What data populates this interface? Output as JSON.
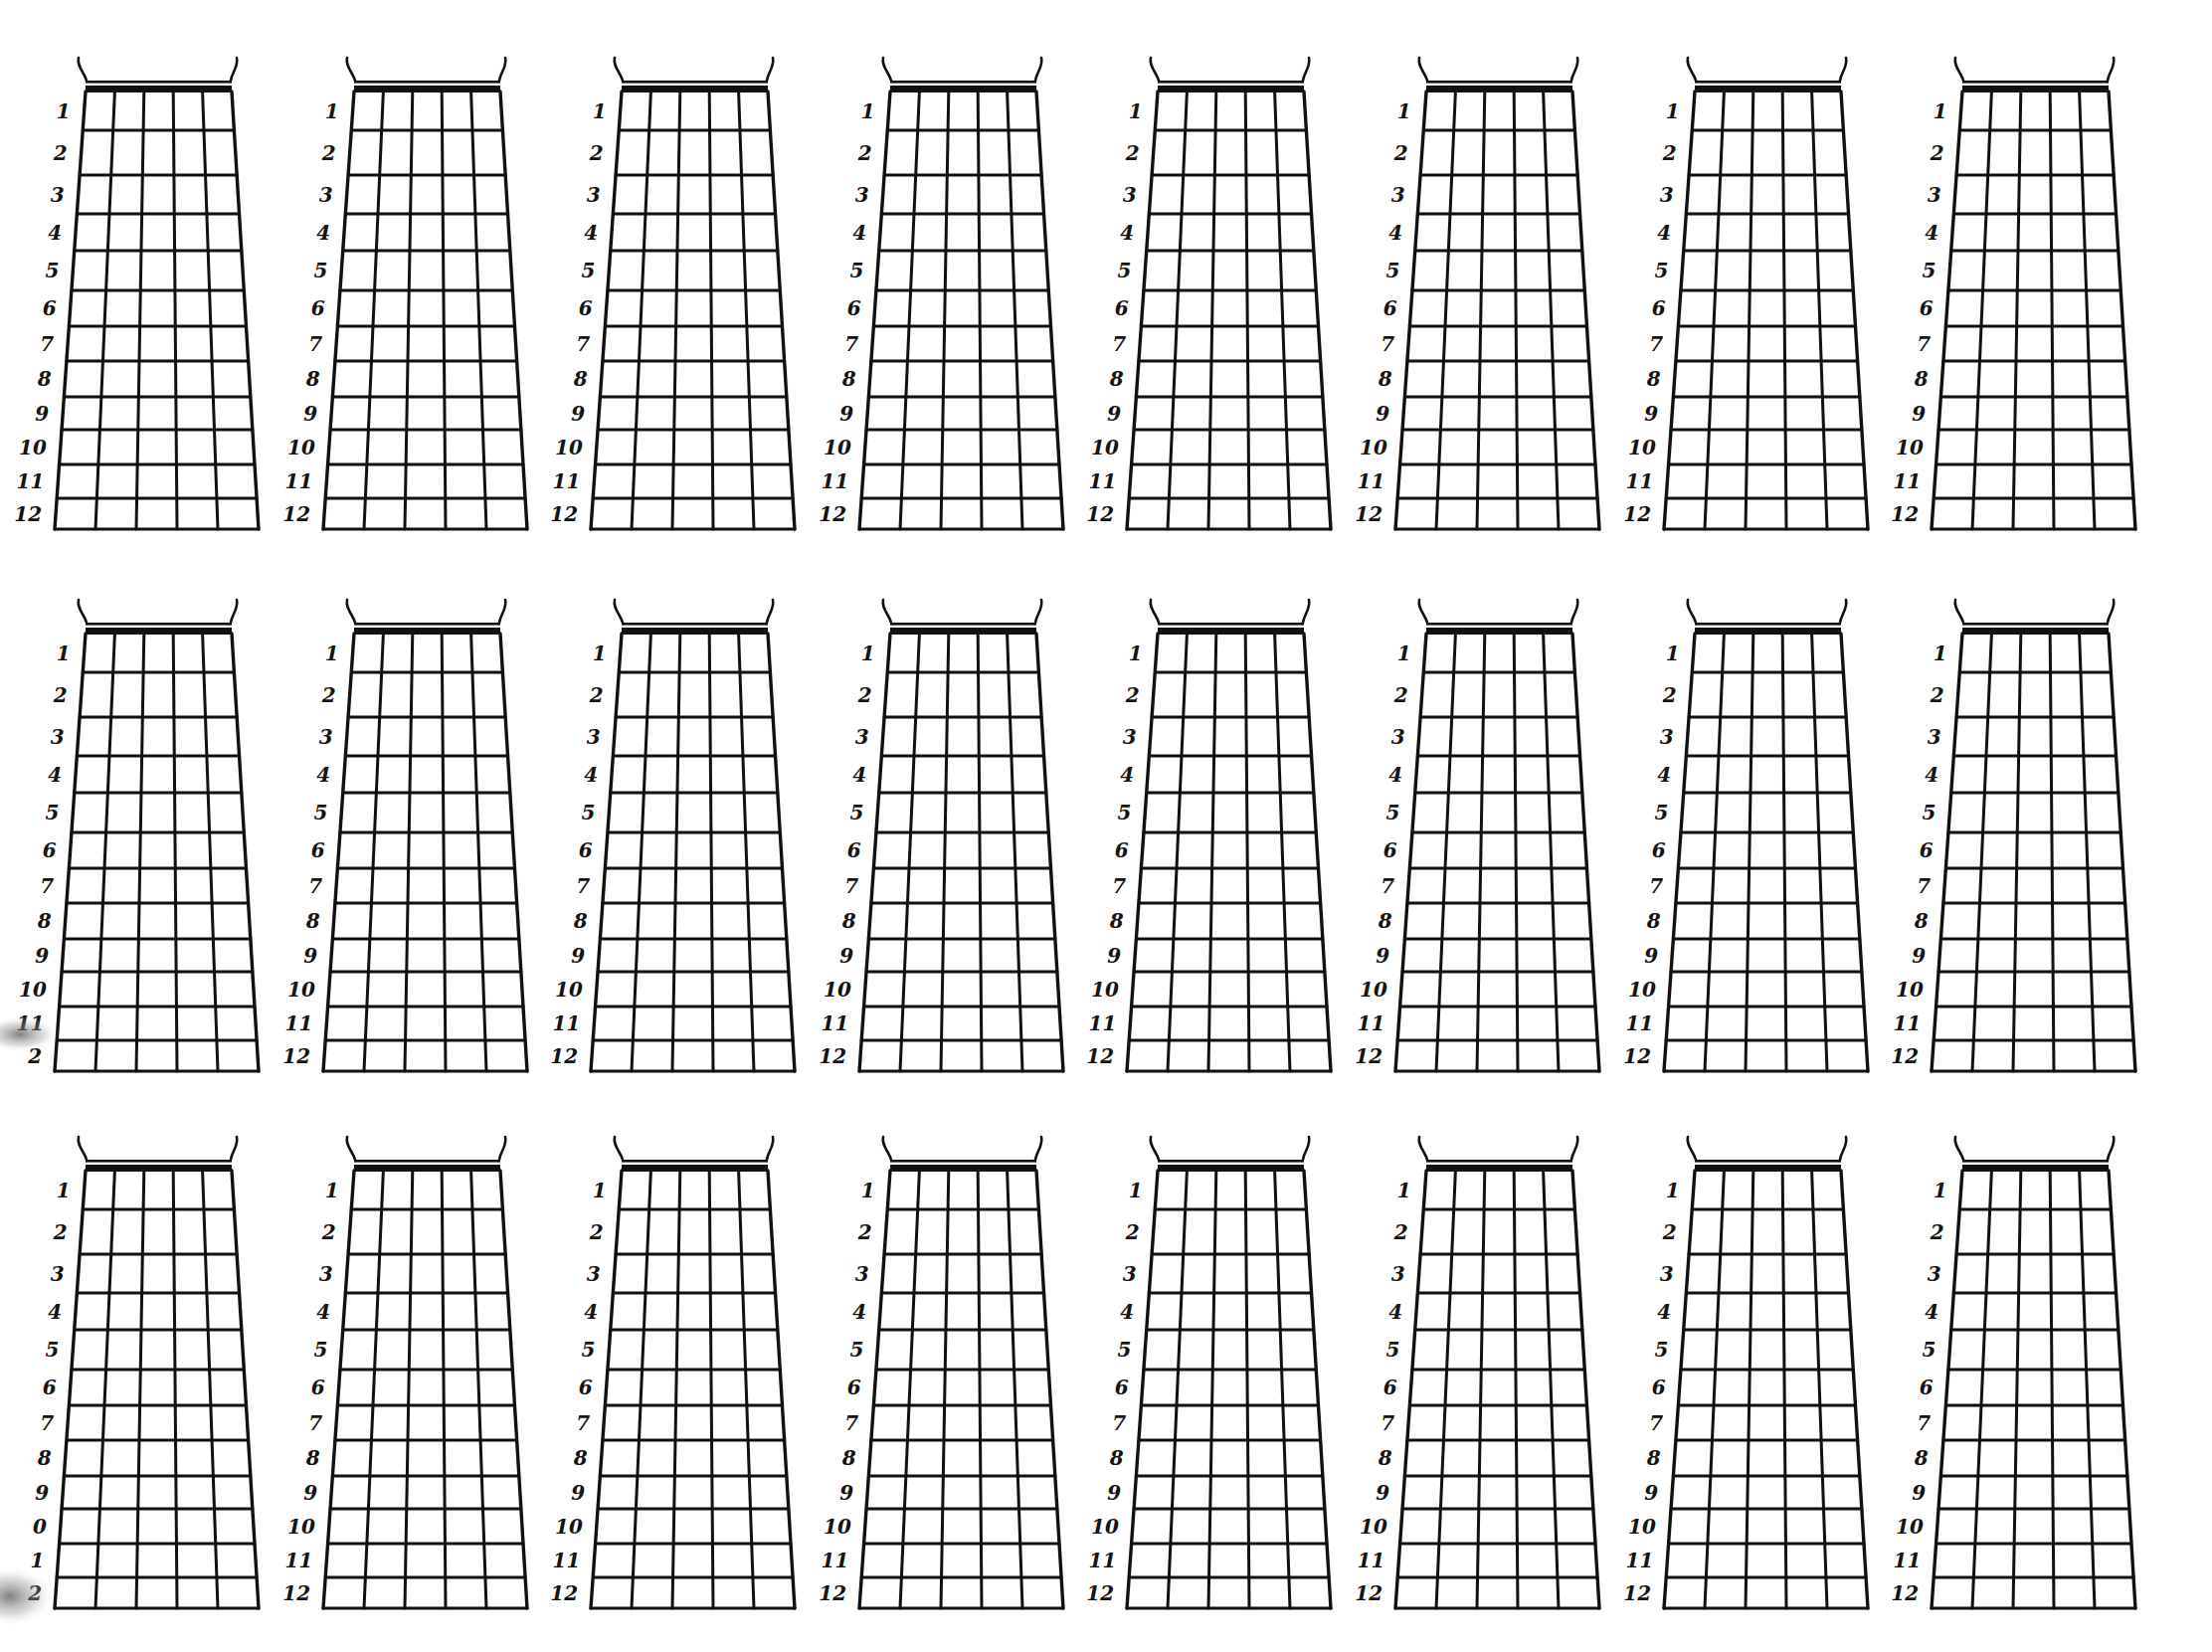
{
  "sheet": {
    "title": "Blank guitar fretboard chart sheet",
    "background": "#ffffff",
    "ink_color": "#111111",
    "rows": 3,
    "columns": 8,
    "strings_per_diagram": 6,
    "frets_per_diagram": 12
  },
  "layout": {
    "column_nut_x": [
      86,
      356,
      625,
      895,
      1164,
      1434,
      1704,
      1973
    ],
    "row_nut_y": [
      93,
      638,
      1178
    ],
    "nut_width": 147,
    "bottom_offset_left": -31,
    "bottom_width": 205,
    "height": 439,
    "fret_offsets": [
      38,
      83,
      122,
      159,
      199,
      235,
      270,
      306,
      339,
      374,
      408,
      439
    ]
  },
  "default_fret_labels": [
    "1",
    "2",
    "3",
    "4",
    "5",
    "6",
    "7",
    "8",
    "9",
    "10",
    "11",
    "12"
  ],
  "label_overrides": {
    "1-0": [
      "1",
      "2",
      "3",
      "4",
      "5",
      "6",
      "7",
      "8",
      "9",
      "10",
      "11",
      "2"
    ],
    "2-0": [
      "1",
      "2",
      "3",
      "4",
      "5",
      "6",
      "7",
      "8",
      "9",
      "0",
      "1",
      "2"
    ]
  },
  "artifacts": [
    {
      "name": "scan-smudge-row2",
      "cx": 20,
      "cy": 1040,
      "rx": 40,
      "ry": 18
    },
    {
      "name": "scan-smudge-row3",
      "cx": 10,
      "cy": 1605,
      "rx": 45,
      "ry": 30
    }
  ]
}
